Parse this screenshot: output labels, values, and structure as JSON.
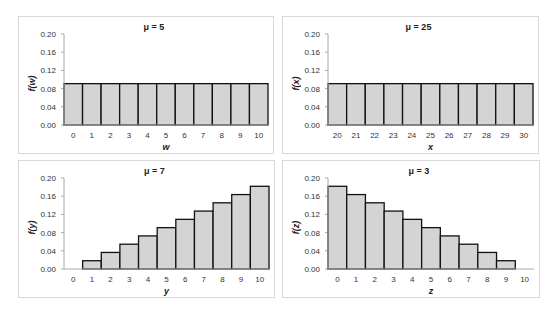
{
  "chart_data": [
    {
      "type": "bar",
      "title": "μ = 5",
      "xlabel": "w",
      "ylabel": "f(w)",
      "categories": [
        "0",
        "1",
        "2",
        "3",
        "4",
        "5",
        "6",
        "7",
        "8",
        "9",
        "10"
      ],
      "values": [
        0.0909,
        0.0909,
        0.0909,
        0.0909,
        0.0909,
        0.0909,
        0.0909,
        0.0909,
        0.0909,
        0.0909,
        0.0909
      ],
      "ylim": [
        0,
        0.2
      ],
      "yticks": [
        "0.00",
        "0.04",
        "0.08",
        "0.12",
        "0.16",
        "0.20"
      ],
      "grid": false,
      "legend": "none"
    },
    {
      "type": "bar",
      "title": "μ = 25",
      "xlabel": "x",
      "ylabel": "f(x)",
      "categories": [
        "20",
        "21",
        "22",
        "23",
        "24",
        "25",
        "26",
        "27",
        "28",
        "29",
        "30"
      ],
      "values": [
        0.0909,
        0.0909,
        0.0909,
        0.0909,
        0.0909,
        0.0909,
        0.0909,
        0.0909,
        0.0909,
        0.0909,
        0.0909
      ],
      "ylim": [
        0,
        0.2
      ],
      "yticks": [
        "0.00",
        "0.04",
        "0.08",
        "0.12",
        "0.16",
        "0.20"
      ],
      "grid": false,
      "legend": "none"
    },
    {
      "type": "bar",
      "title": "μ = 7",
      "xlabel": "y",
      "ylabel": "f(y)",
      "categories": [
        "0",
        "1",
        "2",
        "3",
        "4",
        "5",
        "6",
        "7",
        "8",
        "9",
        "10"
      ],
      "values": [
        0,
        0.0182,
        0.0364,
        0.0545,
        0.0727,
        0.0909,
        0.1091,
        0.1273,
        0.1455,
        0.1636,
        0.1818
      ],
      "ylim": [
        0,
        0.2
      ],
      "yticks": [
        "0.00",
        "0.04",
        "0.08",
        "0.12",
        "0.16",
        "0.20"
      ],
      "grid": false,
      "legend": "none"
    },
    {
      "type": "bar",
      "title": "μ = 3",
      "xlabel": "z",
      "ylabel": "f(z)",
      "categories": [
        "0",
        "1",
        "2",
        "3",
        "4",
        "5",
        "6",
        "7",
        "8",
        "9",
        "10"
      ],
      "values": [
        0.1818,
        0.1636,
        0.1455,
        0.1273,
        0.1091,
        0.0909,
        0.0727,
        0.0545,
        0.0364,
        0.0182,
        0
      ],
      "ylim": [
        0,
        0.2
      ],
      "yticks": [
        "0.00",
        "0.04",
        "0.08",
        "0.12",
        "0.16",
        "0.20"
      ],
      "grid": false,
      "legend": "none"
    }
  ],
  "style": {
    "bar_fill": "#d4d4d4",
    "bar_stroke": "#111111",
    "axis_color": "#aaaaaa",
    "frame_color": "#d9d9d9"
  },
  "panels": [
    {
      "left": 18,
      "top": 16,
      "width": 256,
      "height": 138
    },
    {
      "left": 282,
      "top": 16,
      "width": 257,
      "height": 138
    },
    {
      "left": 18,
      "top": 160,
      "width": 257,
      "height": 138
    },
    {
      "left": 282,
      "top": 160,
      "width": 258,
      "height": 138
    }
  ]
}
